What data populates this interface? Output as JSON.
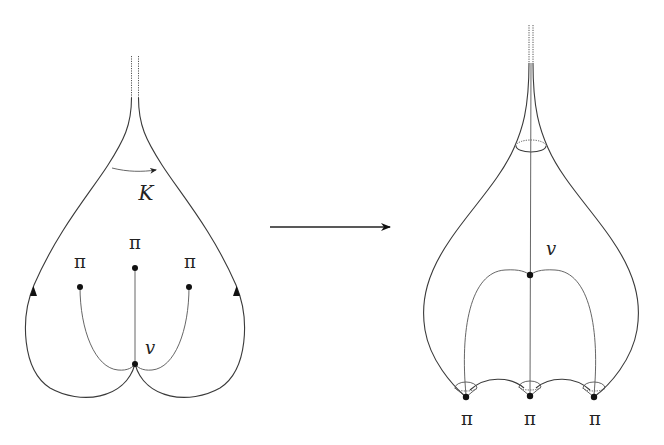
{
  "diagram": {
    "stroke_color": "#3a3a3a",
    "left_figure": {
      "region_label": "K",
      "vertex_label": "v",
      "cone_points": [
        {
          "label": "π",
          "x": 80,
          "y": 287,
          "lx": 80,
          "ly": 268
        },
        {
          "label": "π",
          "x": 135,
          "y": 268,
          "lx": 135,
          "ly": 249
        },
        {
          "label": "π",
          "x": 189,
          "y": 287,
          "lx": 190,
          "ly": 268
        }
      ],
      "vertex": {
        "x": 135,
        "y": 364,
        "lx": 150,
        "ly": 352
      }
    },
    "map_arrow": {
      "x1": 270,
      "y1": 227,
      "x2": 390,
      "y2": 227
    },
    "right_figure": {
      "vertex_label": "v",
      "vertex": {
        "x": 530,
        "y": 275,
        "lx": 551,
        "ly": 255
      },
      "cone_points": [
        {
          "label": "π",
          "x": 466,
          "y": 397,
          "lx": 467,
          "ly": 425
        },
        {
          "label": "π",
          "x": 530,
          "y": 396,
          "lx": 530,
          "ly": 425
        },
        {
          "label": "π",
          "x": 594,
          "y": 397,
          "lx": 595,
          "ly": 425
        }
      ]
    }
  }
}
